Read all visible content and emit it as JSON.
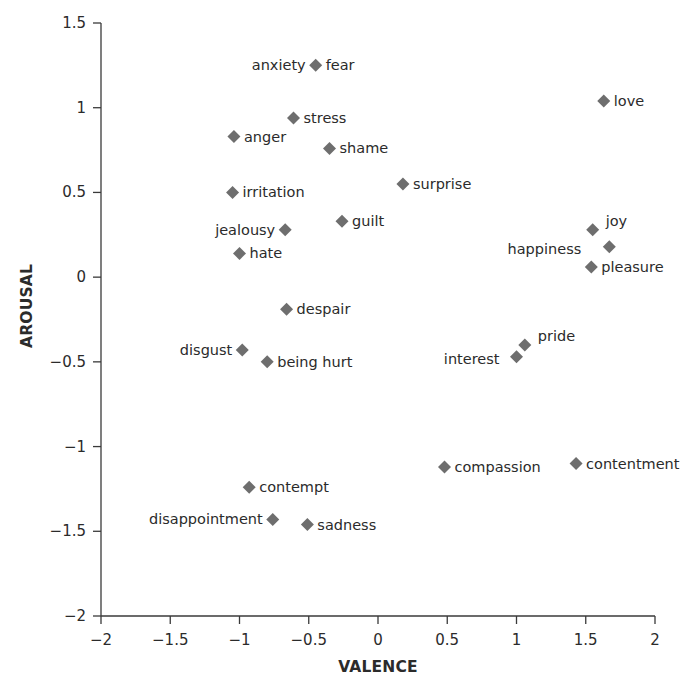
{
  "chart_data": {
    "type": "scatter",
    "title": "",
    "xlabel": "VALENCE",
    "ylabel": "AROUSAL",
    "xlim": [
      -2,
      2
    ],
    "ylim": [
      -2,
      1.5
    ],
    "x_ticks": [
      -2,
      -1.5,
      -1,
      -0.5,
      0,
      0.5,
      1,
      1.5,
      2
    ],
    "x_tick_labels": [
      "−2",
      "−1.5",
      "−1",
      "−0.5",
      "0",
      "0.5",
      "1",
      "1.5",
      "2"
    ],
    "y_ticks": [
      1.5,
      1,
      0.5,
      0,
      -0.5,
      -1,
      -1.5,
      -2
    ],
    "y_tick_labels": [
      "1.5",
      "1",
      "0.5",
      "0",
      "−0.5",
      "−1",
      "−1.5",
      "−2"
    ],
    "grid": false,
    "legend": null,
    "marker": "diamond",
    "marker_color": "#6e6e6e",
    "points": [
      {
        "label": "fear",
        "x": -0.45,
        "y": 1.25,
        "side": "right"
      },
      {
        "label": "anxiety",
        "x": -0.45,
        "y": 1.25,
        "side": "left"
      },
      {
        "label": "love",
        "x": 1.63,
        "y": 1.04,
        "side": "right"
      },
      {
        "label": "stress",
        "x": -0.61,
        "y": 0.94,
        "side": "right"
      },
      {
        "label": "anger",
        "x": -1.04,
        "y": 0.83,
        "side": "right"
      },
      {
        "label": "shame",
        "x": -0.35,
        "y": 0.76,
        "side": "right"
      },
      {
        "label": "surprise",
        "x": 0.18,
        "y": 0.55,
        "side": "right"
      },
      {
        "label": "irritation",
        "x": -1.05,
        "y": 0.5,
        "side": "right"
      },
      {
        "label": "guilt",
        "x": -0.26,
        "y": 0.33,
        "side": "right"
      },
      {
        "label": "jealousy",
        "x": -0.67,
        "y": 0.28,
        "side": "left"
      },
      {
        "label": "joy",
        "x": 1.55,
        "y": 0.28,
        "side": "right-up"
      },
      {
        "label": "happiness",
        "x": 1.67,
        "y": 0.18,
        "side": "left-far"
      },
      {
        "label": "hate",
        "x": -1.0,
        "y": 0.14,
        "side": "right"
      },
      {
        "label": "pleasure",
        "x": 1.54,
        "y": 0.06,
        "side": "right"
      },
      {
        "label": "despair",
        "x": -0.66,
        "y": -0.19,
        "side": "right"
      },
      {
        "label": "pride",
        "x": 1.06,
        "y": -0.4,
        "side": "right-up"
      },
      {
        "label": "disgust",
        "x": -0.98,
        "y": -0.43,
        "side": "left"
      },
      {
        "label": "interest",
        "x": 1.0,
        "y": -0.47,
        "side": "left-down"
      },
      {
        "label": "being hurt",
        "x": -0.8,
        "y": -0.5,
        "side": "right"
      },
      {
        "label": "contentment",
        "x": 1.43,
        "y": -1.1,
        "side": "right"
      },
      {
        "label": "compassion",
        "x": 0.48,
        "y": -1.12,
        "side": "right"
      },
      {
        "label": "contempt",
        "x": -0.93,
        "y": -1.24,
        "side": "right"
      },
      {
        "label": "disappointment",
        "x": -0.76,
        "y": -1.43,
        "side": "left"
      },
      {
        "label": "sadness",
        "x": -0.51,
        "y": -1.46,
        "side": "right"
      }
    ]
  }
}
